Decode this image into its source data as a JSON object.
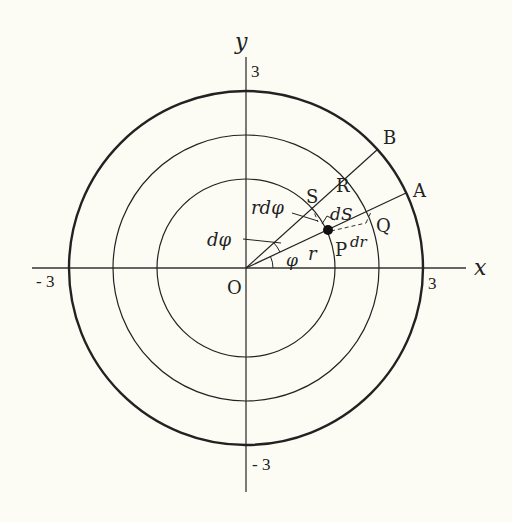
{
  "diagram": {
    "axes": {
      "x_label": "x",
      "y_label": "y",
      "origin_label": "O",
      "ticks": {
        "x_pos": "3",
        "x_neg": "- 3",
        "y_pos": "3",
        "y_neg": "- 3"
      }
    },
    "circles": [
      {
        "name": "inner",
        "radius_units": 1.5
      },
      {
        "name": "middle",
        "radius_units": 2.25
      },
      {
        "name": "outer",
        "radius_units": 3,
        "bold": true
      }
    ],
    "rays": [
      {
        "name": "OA",
        "angle_deg": 25,
        "end_label": "A"
      },
      {
        "name": "OB",
        "angle_deg": 42,
        "end_label": "B"
      }
    ],
    "points": {
      "P": "P",
      "Q": "Q",
      "R": "R",
      "S": "S",
      "A": "A",
      "B": "B"
    },
    "annotations": {
      "r": "r",
      "phi": "φ",
      "d_phi": "dφ",
      "r_d_phi": "rdφ",
      "dS": "dS",
      "dr": "dr"
    },
    "colors": {
      "background": "#fcfcf5",
      "ink": "#222222"
    }
  }
}
